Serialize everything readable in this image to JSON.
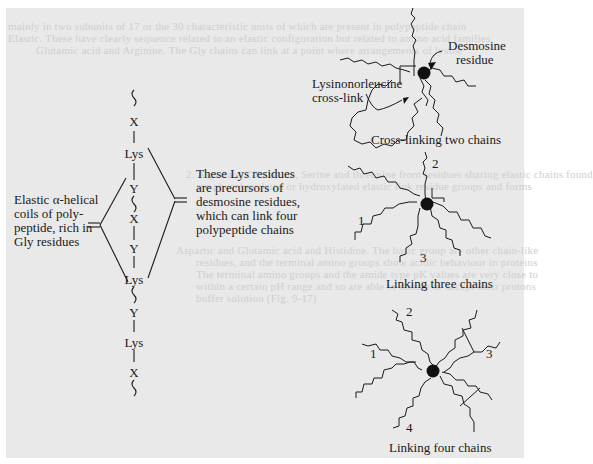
{
  "figure": {
    "background_color": "#e9e9e9",
    "ink_color": "#1a1a1a",
    "chain": {
      "residues": [
        "X",
        "Lys",
        "Y",
        "X",
        "Y",
        "Lys",
        "Y",
        "Lys",
        "X"
      ]
    },
    "left_annotation": {
      "lines": [
        "Elastic α-helical",
        "coils of poly-",
        "peptide, rich in",
        "Gly residues"
      ]
    },
    "middle_annotation": {
      "lines": [
        "These Lys residues",
        "are precursors of",
        "desmosine residues,",
        "which can link four",
        "polypeptide chains"
      ]
    },
    "panels": {
      "two_chains": {
        "caption": "Cross-linking two chains",
        "desmosine_label": [
          "Desmosine",
          "residue"
        ],
        "lysinonorleucine_label": [
          "Lysinonorleucine",
          "cross-link"
        ]
      },
      "three_chains": {
        "caption": "Linking three chains",
        "chain_numbers": [
          "1",
          "2",
          "3"
        ]
      },
      "four_chains": {
        "caption": "Linking four chains",
        "chain_numbers": [
          "1",
          "2",
          "3",
          "4"
        ]
      }
    }
  },
  "background_text": {
    "lines": [
      "mainly in two subunits of 17 or the 30 characteristic units of which are present in polypeptide chain",
      "Elastic. These have clearly sequence related to an elastic configuration but related to amino acid families",
      "Glutamic acid and Arginine. The Gly chains can link at a point where arrangements of lysine",
      "2. Aspartate, Glutamine, Serine and threonine from residues sharing elastic chains found",
      "are phosphorylated or hydroxylated elastic link residue groups and forms",
      "Aspartic and Glutamic acid and Histidine. The basic group are other chain-like",
      "residues, and the terminal amino groups show acidic behaviour in proteins",
      "The terminal amino groups and the amide type pK values are very close to",
      "within a certain pH range and so are able to donate or accept their protons",
      "buffer solution (Fig. 9-17)"
    ]
  }
}
